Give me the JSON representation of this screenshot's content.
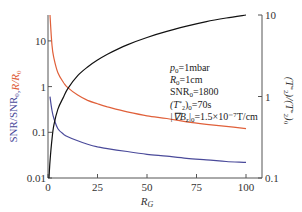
{
  "chart_data": {
    "type": "line",
    "title": "",
    "xlabel": "R_G",
    "ylabel_left": "SNR/SNR_0, R/R_0",
    "ylabel_left_parts": [
      {
        "text": "SNR/SNR",
        "color": "#4a4a9a"
      },
      {
        "text": "0",
        "color": "#4a4a9a",
        "sub": true
      },
      {
        "text": ",",
        "color": "#4a4a9a"
      },
      {
        "text": "R/R",
        "color": "#e0603a",
        "italic": true
      },
      {
        "text": "0",
        "color": "#e0603a",
        "sub": true
      }
    ],
    "ylabel_right": "(T*2)/(T*2)_0",
    "x_range": [
      0,
      100
    ],
    "x_ticks": [
      0,
      25,
      50,
      75,
      100
    ],
    "x_tick_labels": [
      "0",
      "25",
      "50",
      "75",
      "100"
    ],
    "y_left_scale": "log",
    "y_left_range": [
      0.01,
      60
    ],
    "y_left_ticks": [
      0.01,
      0.1,
      1,
      10
    ],
    "y_left_tick_labels": [
      "0.01",
      "0.1",
      "1",
      "10"
    ],
    "y_right_scale": "log",
    "y_right_range": [
      0.1,
      10
    ],
    "y_right_ticks": [
      0.1,
      1,
      10
    ],
    "y_right_tick_labels": [
      "0.1",
      "1",
      "10"
    ],
    "grid": false,
    "series": [
      {
        "name": "R/R0",
        "axis": "left",
        "color": "#e0603a",
        "x": [
          1,
          2,
          3,
          5,
          8,
          10,
          15,
          20,
          25,
          30,
          40,
          50,
          60,
          70,
          80,
          90,
          100
        ],
        "y": [
          40,
          8,
          4.2,
          2.0,
          1.2,
          0.95,
          0.65,
          0.5,
          0.42,
          0.36,
          0.28,
          0.23,
          0.2,
          0.17,
          0.15,
          0.135,
          0.12
        ]
      },
      {
        "name": "SNR/SNR0",
        "axis": "left",
        "color": "#4a4a9a",
        "x": [
          1,
          2,
          3,
          5,
          8,
          10,
          15,
          20,
          25,
          30,
          40,
          50,
          60,
          70,
          80,
          90,
          100
        ],
        "y": [
          0.6,
          0.3,
          0.2,
          0.12,
          0.09,
          0.08,
          0.065,
          0.055,
          0.048,
          0.044,
          0.038,
          0.033,
          0.03,
          0.027,
          0.025,
          0.023,
          0.022
        ]
      },
      {
        "name": "(T*2)/(T*2)0",
        "axis": "right",
        "color": "#111111",
        "x": [
          0.5,
          1,
          2,
          3,
          5,
          8,
          10,
          15,
          20,
          25,
          30,
          40,
          50,
          60,
          70,
          80,
          90,
          100
        ],
        "y": [
          0.1,
          0.16,
          0.3,
          0.45,
          0.7,
          1.0,
          1.25,
          1.8,
          2.3,
          2.8,
          3.3,
          4.3,
          5.3,
          6.3,
          7.3,
          8.3,
          9.2,
          10
        ]
      }
    ],
    "annotations": [
      "p0=1mbar",
      "R0=1cm",
      "SNR0=1800",
      "(T*2)0=70s",
      "|∇Bz|0=1.5×10⁻⁷T/cm"
    ]
  },
  "annotation_lines": [
    {
      "main": "p",
      "italic": true,
      "sub": "0",
      "rest": "=1mbar"
    },
    {
      "main": "R",
      "italic": true,
      "sub": "0",
      "rest": "=1cm"
    },
    {
      "main": "SNR",
      "italic": false,
      "sub": "0",
      "rest": "=1800"
    },
    {
      "main": "(T*2)",
      "italic": true,
      "sub": "0",
      "rest": "=70s"
    },
    {
      "main": "|∇B",
      "italic": true,
      "sub": "z",
      "rest": "|",
      "sub2": "0",
      "rest2": "=1.5×10⁻⁷T/cm"
    }
  ]
}
